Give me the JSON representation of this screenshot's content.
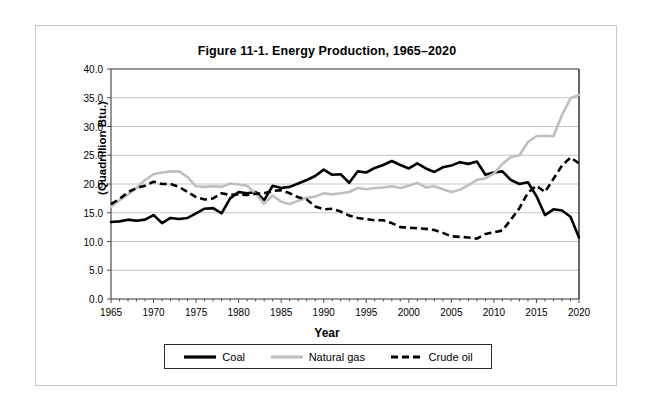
{
  "figure": {
    "title": "Figure 11-1. Energy Production, 1965–2020",
    "ylabel": "(Quadrillion Btu.)",
    "xlabel": "Year"
  },
  "colors": {
    "coal": "#000000",
    "natural_gas": "#bfbfbf",
    "crude_oil": "#000000",
    "grid": "#c4c4c4",
    "axis": "#4d4d4d",
    "frame": "#c9c9c9",
    "legend_border": "#2b2b2b",
    "background": "#ffffff"
  },
  "legend": {
    "position": "bottom",
    "items": [
      {
        "label": "Coal",
        "style": "solid",
        "color": "#000000",
        "width": 3.2
      },
      {
        "label": "Natural gas",
        "style": "solid",
        "color": "#bfbfbf",
        "width": 3.2
      },
      {
        "label": "Crude oil",
        "style": "dashed",
        "color": "#000000",
        "width": 3.2
      }
    ]
  },
  "chart_data": {
    "type": "line",
    "title": "Figure 11-1. Energy Production, 1965–2020",
    "xlabel": "Year",
    "ylabel": "(Quadrillion Btu.)",
    "xlim": [
      1965,
      2020
    ],
    "ylim": [
      0.0,
      40.0
    ],
    "ytick_step": 5.0,
    "xtick_step": 5,
    "xtick_minor_step": 1,
    "grid": true,
    "ytick_labels": [
      "0.0",
      "5.0",
      "10.0",
      "15.0",
      "20.0",
      "25.0",
      "30.0",
      "35.0",
      "40.0"
    ],
    "ytick_values": [
      0.0,
      5.0,
      10.0,
      15.0,
      20.0,
      25.0,
      30.0,
      35.0,
      40.0
    ],
    "xtick_labels": [
      "1965",
      "1970",
      "1975",
      "1980",
      "1985",
      "1990",
      "1995",
      "2000",
      "2005",
      "2010",
      "2015",
      "2020"
    ],
    "xtick_values": [
      1965,
      1970,
      1975,
      1980,
      1985,
      1990,
      1995,
      2000,
      2005,
      2010,
      2015,
      2020
    ],
    "x": [
      1965,
      1966,
      1967,
      1968,
      1969,
      1970,
      1971,
      1972,
      1973,
      1974,
      1975,
      1976,
      1977,
      1978,
      1979,
      1980,
      1981,
      1982,
      1983,
      1984,
      1985,
      1986,
      1987,
      1988,
      1989,
      1990,
      1991,
      1992,
      1993,
      1994,
      1995,
      1996,
      1997,
      1998,
      1999,
      2000,
      2001,
      2002,
      2003,
      2004,
      2005,
      2006,
      2007,
      2008,
      2009,
      2010,
      2011,
      2012,
      2013,
      2014,
      2015,
      2016,
      2017,
      2018,
      2019,
      2020
    ],
    "series": [
      {
        "name": "Coal",
        "style": "solid",
        "color": "#000000",
        "values": [
          13.4,
          13.5,
          13.8,
          13.6,
          13.8,
          14.6,
          13.2,
          14.1,
          13.9,
          14.1,
          14.9,
          15.7,
          15.8,
          14.9,
          17.5,
          18.6,
          18.4,
          18.6,
          17.2,
          19.7,
          19.3,
          19.5,
          20.1,
          20.7,
          21.4,
          22.5,
          21.6,
          21.7,
          20.2,
          22.2,
          22.0,
          22.8,
          23.3,
          24.0,
          23.3,
          22.7,
          23.6,
          22.7,
          22.1,
          22.9,
          23.2,
          23.8,
          23.5,
          23.9,
          21.6,
          22.0,
          22.2,
          20.7,
          20.0,
          20.3,
          17.9,
          14.6,
          15.6,
          15.4,
          14.3,
          10.7
        ]
      },
      {
        "name": "Natural gas",
        "style": "solid",
        "color": "#bfbfbf",
        "values": [
          16.0,
          17.2,
          18.2,
          19.3,
          20.7,
          21.7,
          22.0,
          22.2,
          22.2,
          21.2,
          19.6,
          19.5,
          19.6,
          19.5,
          20.1,
          19.9,
          19.7,
          18.3,
          16.6,
          18.0,
          16.9,
          16.5,
          17.1,
          17.6,
          17.8,
          18.4,
          18.2,
          18.4,
          18.6,
          19.3,
          19.1,
          19.3,
          19.4,
          19.6,
          19.3,
          19.7,
          20.2,
          19.4,
          19.6,
          19.1,
          18.6,
          19.0,
          19.8,
          20.7,
          21.0,
          21.8,
          23.5,
          24.7,
          25.0,
          27.3,
          28.3,
          28.4,
          28.3,
          32.0,
          34.9,
          35.5
        ]
      },
      {
        "name": "Crude oil",
        "style": "dashed",
        "color": "#000000",
        "values": [
          16.5,
          17.4,
          18.6,
          19.3,
          19.7,
          20.4,
          20.0,
          20.0,
          19.5,
          18.6,
          17.7,
          17.3,
          17.5,
          18.4,
          18.1,
          18.2,
          18.1,
          18.3,
          18.4,
          18.8,
          18.9,
          18.4,
          17.7,
          17.3,
          16.1,
          15.6,
          15.7,
          15.2,
          14.5,
          14.1,
          13.9,
          13.7,
          13.7,
          13.2,
          12.5,
          12.4,
          12.3,
          12.2,
          12.0,
          11.5,
          10.9,
          10.8,
          10.7,
          10.5,
          11.3,
          11.6,
          11.9,
          13.8,
          15.8,
          18.5,
          19.7,
          18.6,
          20.9,
          23.2,
          24.6,
          23.6
        ]
      }
    ]
  }
}
